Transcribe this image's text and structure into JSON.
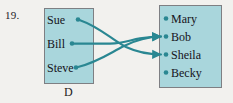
{
  "figure": {
    "problem_number": "19.",
    "domain_set": {
      "label": "D",
      "members": [
        "Sue",
        "Bill",
        "Steve"
      ]
    },
    "codomain_set": {
      "label": "",
      "members": [
        "Mary",
        "Bob",
        "Sheila",
        "Becky"
      ]
    },
    "arrows": [
      {
        "from": "Sue",
        "to": "Sheila"
      },
      {
        "from": "Bill",
        "to": "Bob"
      },
      {
        "from": "Steve",
        "to": "Bob"
      }
    ],
    "colors": {
      "box_fill": "#a9d6dc",
      "box_border": "#7e7f83",
      "arrow": "#2a8792",
      "text": "#15131a",
      "background": "#f2f1ee"
    }
  }
}
